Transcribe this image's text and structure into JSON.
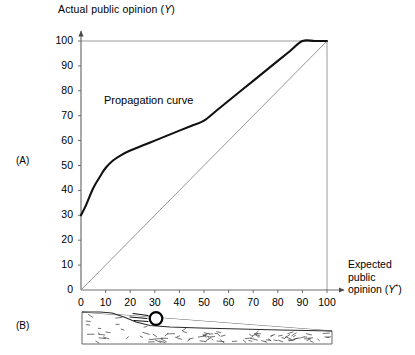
{
  "figure": {
    "panels": [
      {
        "id": "A",
        "label": "(A)"
      },
      {
        "id": "B",
        "label": "(B)"
      }
    ]
  },
  "axis_titles": {
    "y_prefix": "Actual public opinion (",
    "y_variable": "Y",
    "y_suffix": ")",
    "x_line1": "Expected",
    "x_line2": "public",
    "x_line3_prefix": "opinion (",
    "x_variable": "Y",
    "x_star": "*",
    "x_line3_suffix": ")"
  },
  "annotations": {
    "propagation_curve": "Propagation curve"
  },
  "colors": {
    "curve": "#111111",
    "diagonal": "#8a8a8a",
    "axis": "#6e6e6e",
    "frame": "#8a8a8a",
    "text": "#1a1a1a",
    "background": "#ffffff"
  },
  "chart_data": {
    "type": "line",
    "title": "Actual public opinion (Y)",
    "xlabel": "Expected public opinion (Y*)",
    "ylabel": "Actual public opinion (Y)",
    "xlim": [
      0,
      100
    ],
    "ylim": [
      0,
      100
    ],
    "grid": false,
    "legend": "none",
    "xticks": [
      0,
      10,
      20,
      30,
      40,
      50,
      60,
      70,
      80,
      90,
      100
    ],
    "yticks": [
      0,
      10,
      20,
      30,
      40,
      50,
      60,
      70,
      80,
      90,
      100
    ],
    "xtick_labels": [
      "0",
      "10",
      "20",
      "30",
      "40",
      "50",
      "60",
      "70",
      "80",
      "90",
      "100"
    ],
    "ytick_labels": [
      "0",
      "10",
      "20",
      "30",
      "40",
      "50",
      "60",
      "70",
      "80",
      "90",
      "100"
    ],
    "series": [
      {
        "name": "Propagation curve",
        "style": "thick-solid",
        "color": "#111111",
        "x": [
          0,
          2,
          5,
          8,
          10,
          13,
          16,
          20,
          25,
          30,
          35,
          40,
          45,
          50,
          55,
          60,
          65,
          70,
          75,
          80,
          85,
          90,
          95,
          100
        ],
        "y": [
          30,
          34,
          41,
          46,
          49,
          52,
          54,
          56,
          58,
          60,
          62,
          64,
          66,
          68,
          72,
          76,
          80,
          84,
          88,
          92,
          96,
          100,
          100,
          100
        ]
      },
      {
        "name": "45-degree line",
        "style": "thin-solid",
        "color": "#8a8a8a",
        "x": [
          0,
          100
        ],
        "y": [
          0,
          100
        ]
      }
    ],
    "reference_lines": [
      {
        "name": "top-border",
        "orientation": "horizontal",
        "value": 100
      },
      {
        "name": "right-border",
        "orientation": "vertical",
        "value": 100
      }
    ]
  },
  "panel_b": {
    "description": "ball-on-slope schematic",
    "elements": [
      {
        "name": "hillside-slope",
        "kind": "shape"
      },
      {
        "name": "rolling-ball",
        "kind": "circle"
      },
      {
        "name": "motion-lines",
        "kind": "lines"
      },
      {
        "name": "ground-baseline",
        "kind": "line"
      }
    ]
  }
}
